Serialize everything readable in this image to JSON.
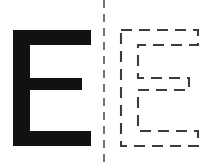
{
  "figure": {
    "background_color": "#ffffff",
    "width": 209,
    "height": 168
  },
  "left_panel": {
    "name": "solid-shape-panel",
    "glyph": "E",
    "style": "solid filled",
    "fill_color": "#111111",
    "geometry": {
      "stem_left": 13,
      "stem_right": 30,
      "top": 30,
      "bottom": 146,
      "top_arm_right": 91,
      "top_arm_bottom": 45,
      "mid_arm_top": 78,
      "mid_arm_bottom": 90,
      "mid_arm_right": 82,
      "bottom_arm_top": 131,
      "bottom_arm_right": 91
    },
    "path": "M13,30 L91,30 L91,45 L30,45 L30,78 L82,78 L82,90 L30,90 L30,131 L91,131 L91,146 L13,146 Z"
  },
  "divider": {
    "name": "vertical-dashed-divider",
    "color": "#444444",
    "dash_pattern": "8 6",
    "x": 104,
    "y_start": 0,
    "y_end": 168
  },
  "right_panel": {
    "name": "contour-outline-panel",
    "glyph": "E",
    "style": "dashed outline",
    "stroke_color": "#3c3c3c",
    "dash_pattern": "11 7",
    "stroke_width": 2.1,
    "geometry": {
      "stem_left": 121,
      "stem_right": 138,
      "top": 30,
      "bottom": 146,
      "top_arm_right": 198,
      "top_arm_bottom": 45,
      "mid_arm_top": 78,
      "mid_arm_bottom": 90,
      "mid_arm_right": 189,
      "bottom_arm_top": 131,
      "bottom_arm_right": 198
    },
    "path": "M121,30 L198,30 L198,45 L138,45 L138,78 L189,78 L189,90 L138,90 L138,131 L198,131 L198,146 L121,146 Z"
  }
}
